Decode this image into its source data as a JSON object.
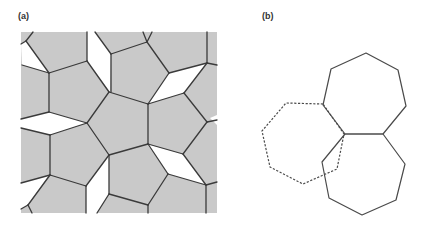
{
  "panels": {
    "a": {
      "label": "(a)",
      "box": {
        "x": 21,
        "y": 32,
        "w": 196,
        "h": 181
      },
      "fill": "#c9c9c9",
      "stroke": "#3a3a3a",
      "gaps": [
        [
          [
            21,
            44
          ],
          [
            26,
            41
          ],
          [
            49,
            73
          ],
          [
            22,
            65
          ]
        ],
        [
          [
            87,
            32
          ],
          [
            95,
            32
          ],
          [
            111,
            54
          ],
          [
            110,
            92
          ],
          [
            87,
            61
          ]
        ],
        [
          [
            169,
            73
          ],
          [
            207,
            63
          ],
          [
            184,
            93
          ],
          [
            148,
            104
          ]
        ],
        [
          [
            21,
            119
          ],
          [
            49,
            112
          ],
          [
            87,
            123
          ],
          [
            50,
            135
          ],
          [
            21,
            128
          ]
        ],
        [
          [
            147,
            144
          ],
          [
            183,
            154
          ],
          [
            206,
            185
          ],
          [
            168,
            174
          ]
        ],
        [
          [
            86,
            186
          ],
          [
            109,
            155
          ],
          [
            109,
            194
          ],
          [
            97,
            213
          ],
          [
            86,
            213
          ]
        ],
        [
          [
            21,
            183
          ],
          [
            49,
            175
          ],
          [
            28,
            205
          ],
          [
            21,
            209
          ]
        ],
        [
          [
            210,
            118
          ],
          [
            217,
            115
          ],
          [
            217,
            125
          ]
        ]
      ],
      "edges": [
        [
          [
            26,
            41
          ],
          [
            33,
            32
          ]
        ],
        [
          [
            26,
            41
          ],
          [
            21,
            44
          ]
        ],
        [
          [
            26,
            41
          ],
          [
            49,
            73
          ]
        ],
        [
          [
            22,
            65
          ],
          [
            49,
            73
          ]
        ],
        [
          [
            49,
            73
          ],
          [
            87,
            61
          ]
        ],
        [
          [
            87,
            61
          ],
          [
            87,
            32
          ]
        ],
        [
          [
            87,
            61
          ],
          [
            109,
            92
          ]
        ],
        [
          [
            95,
            32
          ],
          [
            111,
            54
          ]
        ],
        [
          [
            111,
            54
          ],
          [
            111,
            92
          ]
        ],
        [
          [
            111,
            54
          ],
          [
            147,
            42
          ]
        ],
        [
          [
            147,
            42
          ],
          [
            152,
            32
          ]
        ],
        [
          [
            147,
            42
          ],
          [
            143,
            32
          ]
        ],
        [
          [
            147,
            42
          ],
          [
            169,
            73
          ]
        ],
        [
          [
            169,
            73
          ],
          [
            207,
            63
          ]
        ],
        [
          [
            207,
            63
          ],
          [
            207,
            32
          ]
        ],
        [
          [
            207,
            63
          ],
          [
            217,
            65
          ]
        ],
        [
          [
            207,
            63
          ],
          [
            184,
            93
          ]
        ],
        [
          [
            184,
            93
          ],
          [
            148,
            104
          ]
        ],
        [
          [
            169,
            73
          ],
          [
            148,
            104
          ]
        ],
        [
          [
            109,
            92
          ],
          [
            148,
            104
          ]
        ],
        [
          [
            109,
            92
          ],
          [
            87,
            123
          ]
        ],
        [
          [
            148,
            104
          ],
          [
            148,
            144
          ]
        ],
        [
          [
            184,
            93
          ],
          [
            207,
            122
          ]
        ],
        [
          [
            207,
            122
          ],
          [
            217,
            120
          ]
        ],
        [
          [
            207,
            122
          ],
          [
            183,
            154
          ]
        ],
        [
          [
            49,
            73
          ],
          [
            49,
            112
          ]
        ],
        [
          [
            49,
            112
          ],
          [
            21,
            119
          ]
        ],
        [
          [
            49,
            112
          ],
          [
            87,
            123
          ]
        ],
        [
          [
            87,
            123
          ],
          [
            50,
            135
          ]
        ],
        [
          [
            50,
            135
          ],
          [
            21,
            128
          ]
        ],
        [
          [
            87,
            123
          ],
          [
            109,
            155
          ]
        ],
        [
          [
            109,
            155
          ],
          [
            148,
            144
          ]
        ],
        [
          [
            148,
            144
          ],
          [
            183,
            154
          ]
        ],
        [
          [
            183,
            154
          ],
          [
            206,
            185
          ]
        ],
        [
          [
            206,
            185
          ],
          [
            168,
            174
          ]
        ],
        [
          [
            168,
            174
          ],
          [
            148,
            144
          ]
        ],
        [
          [
            206,
            185
          ],
          [
            217,
            182
          ]
        ],
        [
          [
            206,
            185
          ],
          [
            206,
            213
          ]
        ],
        [
          [
            168,
            174
          ],
          [
            148,
            205
          ]
        ],
        [
          [
            148,
            205
          ],
          [
            148,
            213
          ]
        ],
        [
          [
            109,
            194
          ],
          [
            148,
            205
          ]
        ],
        [
          [
            109,
            155
          ],
          [
            109,
            194
          ]
        ],
        [
          [
            109,
            155
          ],
          [
            86,
            186
          ]
        ],
        [
          [
            109,
            194
          ],
          [
            97,
            213
          ]
        ],
        [
          [
            86,
            186
          ],
          [
            86,
            213
          ]
        ],
        [
          [
            50,
            135
          ],
          [
            50,
            175
          ]
        ],
        [
          [
            50,
            175
          ],
          [
            86,
            186
          ]
        ],
        [
          [
            50,
            175
          ],
          [
            21,
            183
          ]
        ],
        [
          [
            50,
            175
          ],
          [
            28,
            205
          ]
        ],
        [
          [
            28,
            205
          ],
          [
            21,
            209
          ]
        ],
        [
          [
            28,
            205
          ],
          [
            32,
            213
          ]
        ]
      ]
    },
    "b": {
      "label": "(b)",
      "stroke": "#4a4a4a",
      "heptagons": [
        {
          "name": "top-heptagon",
          "style": "solid",
          "points": [
            [
              366,
              53
            ],
            [
              398,
              70
            ],
            [
              406,
              106
            ],
            [
              383,
              134
            ],
            [
              345,
              134
            ],
            [
              323,
              105
            ],
            [
              331,
              69
            ]
          ]
        },
        {
          "name": "bottom-heptagon",
          "style": "solid",
          "points": [
            [
              345,
              134
            ],
            [
              383,
              134
            ],
            [
              405,
              164
            ],
            [
              396,
              200
            ],
            [
              362,
              215
            ],
            [
              329,
              198
            ],
            [
              322,
              162
            ]
          ]
        },
        {
          "name": "dashed-heptagon",
          "style": "dashed",
          "points": [
            [
              323,
              104
            ],
            [
              286,
              103
            ],
            [
              262,
              131
            ],
            [
              270,
              167
            ],
            [
              303,
              184
            ],
            [
              337,
              169
            ],
            [
              344,
              134
            ]
          ]
        }
      ]
    }
  }
}
